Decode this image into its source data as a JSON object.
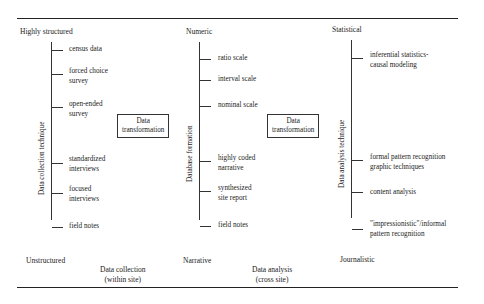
{
  "diagram": {
    "columns": [
      {
        "id": "collection",
        "top_label": "Highly structured",
        "bottom_label": "Unstructured",
        "axis_label": "Data collection technique",
        "ticks": [
          "census data",
          "forced choice\nsurvey",
          "open-ended\nsurvey",
          "standardized\ninterviews",
          "focused\ninterviews",
          "field notes"
        ]
      },
      {
        "id": "database",
        "top_label": "Numeric",
        "bottom_label": "Narrative",
        "axis_label": "Database formation",
        "ticks": [
          "ratio scale",
          "interval scale",
          "nominal scale",
          "highly coded\nnarrative",
          "synthesized\nsite report",
          "field notes"
        ]
      },
      {
        "id": "analysis",
        "top_label": "Statistical",
        "bottom_label": "Journalistic",
        "axis_label": "Data analysis technique",
        "ticks": [
          "inferential statistics-\ncausal modeling",
          "formal pattern recognition\ngraphic techniques",
          "content analysis",
          "\"impressionistic\"/informal\npattern recognition"
        ]
      }
    ],
    "transformation_boxes": [
      "Data\ntransformation",
      "Data\ntransformation"
    ],
    "stages": [
      "Data collection\n(within site)",
      "Data analysis\n(cross site)"
    ]
  }
}
